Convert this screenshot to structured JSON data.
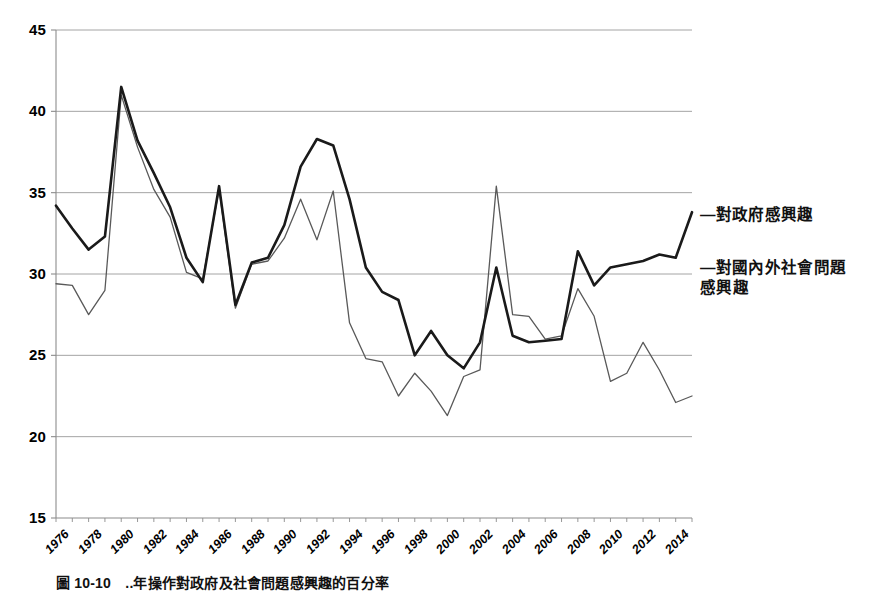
{
  "chart_data": {
    "type": "line",
    "title": "",
    "xlabel": "",
    "ylabel": "",
    "ylim": [
      15,
      45
    ],
    "ytick_step": 5,
    "yticks": [
      "45",
      "40",
      "35",
      "30",
      "25",
      "20",
      "15"
    ],
    "grid": true,
    "legend_position": "right",
    "xlim": [
      1976,
      2015
    ],
    "x": [
      1976,
      1977,
      1978,
      1979,
      1980,
      1981,
      1982,
      1983,
      1984,
      1985,
      1986,
      1987,
      1988,
      1989,
      1990,
      1991,
      1992,
      1993,
      1994,
      1995,
      1996,
      1997,
      1998,
      1999,
      2000,
      2001,
      2002,
      2003,
      2004,
      2005,
      2006,
      2007,
      2008,
      2009,
      2010,
      2011,
      2012,
      2013,
      2014,
      2015
    ],
    "xticks": [
      "1976",
      "1978",
      "1980",
      "1982",
      "1984",
      "1986",
      "1988",
      "1990",
      "1992",
      "1994",
      "1996",
      "1998",
      "2000",
      "2002",
      "2004",
      "2006",
      "2008",
      "2010",
      "2012",
      "2014"
    ],
    "series": [
      {
        "name": "對政府感興趣",
        "style": "bold-black",
        "color": "#1a1a1a",
        "width": 2.6,
        "values": [
          34.2,
          32.8,
          31.5,
          32.3,
          41.5,
          38.2,
          36.2,
          34.1,
          31.0,
          29.5,
          35.4,
          28.1,
          30.7,
          31.0,
          33.0,
          36.6,
          38.3,
          37.9,
          34.6,
          30.4,
          28.9,
          28.4,
          25.0,
          26.5,
          25.0,
          24.2,
          25.8,
          30.4,
          26.2,
          25.8,
          25.9,
          26.0,
          31.4,
          29.3,
          30.4,
          30.6,
          30.8,
          31.2,
          31.0,
          33.8
        ]
      },
      {
        "name": "對國內外社會問題感興趣",
        "style": "thin-gray",
        "color": "#595959",
        "width": 1.3,
        "values": [
          29.4,
          29.3,
          27.5,
          29.0,
          41.0,
          37.8,
          35.2,
          33.5,
          30.1,
          29.7,
          35.2,
          27.9,
          30.6,
          30.8,
          32.2,
          34.6,
          32.1,
          35.1,
          27.0,
          24.8,
          24.6,
          22.5,
          23.9,
          22.8,
          21.3,
          23.7,
          24.1,
          35.4,
          27.5,
          27.4,
          26.0,
          26.2,
          29.1,
          27.4,
          23.4,
          23.9,
          25.8,
          24.1,
          22.1,
          22.5
        ]
      }
    ],
    "legend": [
      {
        "prefix": "—",
        "label": "對政府感興趣"
      },
      {
        "prefix": "—",
        "label": "對國內外社會問題",
        "label2": "感興趣"
      }
    ]
  },
  "legend": {
    "entry1": "—對政府感興趣",
    "entry2": "—對國內外社會問題",
    "entry2_cont": "感興趣"
  },
  "caption": {
    "text": "圖 10-10　..年操作對政府及社會問題感興趣的百分率"
  }
}
